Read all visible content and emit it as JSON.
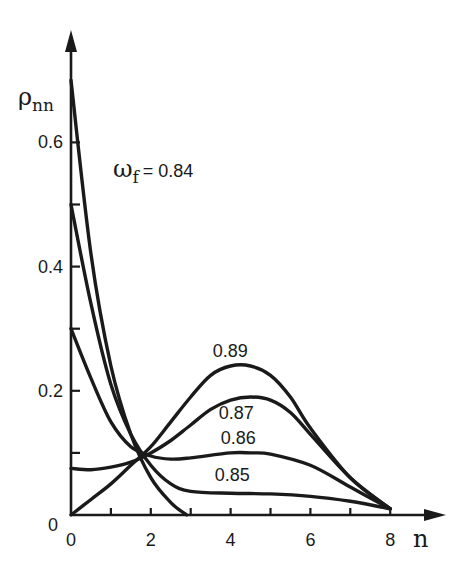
{
  "chart_data": {
    "type": "line",
    "title": "",
    "xlabel": "n",
    "ylabel": "ρ_nn",
    "ylabel_main": "ρ",
    "ylabel_sub": "nn",
    "xlim": [
      0,
      8.5
    ],
    "ylim": [
      0,
      0.75
    ],
    "grid": false,
    "legend": "inline labels",
    "x_ticks": [
      {
        "value": 0,
        "label": "0"
      },
      {
        "value": 1,
        "label": ""
      },
      {
        "value": 2,
        "label": "2"
      },
      {
        "value": 3,
        "label": ""
      },
      {
        "value": 4,
        "label": "4"
      },
      {
        "value": 5,
        "label": ""
      },
      {
        "value": 6,
        "label": "6"
      },
      {
        "value": 7,
        "label": ""
      },
      {
        "value": 8,
        "label": "8"
      }
    ],
    "y_ticks": [
      {
        "value": 0.1,
        "label": ""
      },
      {
        "value": 0.2,
        "label": "0.2"
      },
      {
        "value": 0.3,
        "label": ""
      },
      {
        "value": 0.4,
        "label": "0.4"
      },
      {
        "value": 0.5,
        "label": ""
      },
      {
        "value": 0.6,
        "label": "0.6"
      }
    ],
    "origin_label": "0",
    "series": [
      {
        "name": "ω_f = 0.84",
        "label": "0.84",
        "label_prefix": "ω",
        "label_sub": "f",
        "label_eq": "= 0.84",
        "x": [
          0,
          0.5,
          1.0,
          1.5,
          2.0,
          2.5,
          2.9
        ],
        "values": [
          0.7,
          0.42,
          0.24,
          0.13,
          0.06,
          0.02,
          0.0
        ]
      },
      {
        "name": "0.85",
        "label": "0.85",
        "x": [
          0,
          0.5,
          1.0,
          1.5,
          2.0,
          2.5,
          3.0,
          4.0,
          5.0,
          6.0,
          7.0,
          8.0
        ],
        "values": [
          0.5,
          0.34,
          0.21,
          0.13,
          0.08,
          0.05,
          0.038,
          0.035,
          0.034,
          0.03,
          0.022,
          0.01
        ]
      },
      {
        "name": "0.86",
        "label": "0.86",
        "x": [
          0,
          0.5,
          1.0,
          1.5,
          2.0,
          2.5,
          3.0,
          4.0,
          4.5,
          5.0,
          6.0,
          7.0,
          8.0
        ],
        "values": [
          0.3,
          0.22,
          0.15,
          0.11,
          0.095,
          0.09,
          0.092,
          0.1,
          0.1,
          0.098,
          0.08,
          0.045,
          0.01
        ]
      },
      {
        "name": "0.87",
        "label": "0.87",
        "x": [
          0,
          0.5,
          1.0,
          1.5,
          2.0,
          2.5,
          3.0,
          3.5,
          4.0,
          4.5,
          5.0,
          5.5,
          6.0,
          7.0,
          8.0
        ],
        "values": [
          0.075,
          0.073,
          0.077,
          0.085,
          0.1,
          0.12,
          0.145,
          0.17,
          0.185,
          0.19,
          0.185,
          0.165,
          0.13,
          0.06,
          0.01
        ]
      },
      {
        "name": "0.89",
        "label": "0.89",
        "x": [
          0,
          0.5,
          1.0,
          1.5,
          2.0,
          2.5,
          3.0,
          3.5,
          4.0,
          4.5,
          5.0,
          5.5,
          6.0,
          7.0,
          8.0
        ],
        "values": [
          0.0,
          0.025,
          0.05,
          0.08,
          0.11,
          0.15,
          0.19,
          0.225,
          0.24,
          0.24,
          0.225,
          0.19,
          0.14,
          0.06,
          0.01
        ]
      }
    ],
    "label_positions": [
      {
        "series": "ω_f = 0.84",
        "x": 1.05,
        "y": 0.545
      },
      {
        "series": "0.85",
        "x": 3.6,
        "y": 0.055
      },
      {
        "series": "0.86",
        "x": 3.75,
        "y": 0.115
      },
      {
        "series": "0.87",
        "x": 3.7,
        "y": 0.155
      },
      {
        "series": "0.89",
        "x": 3.55,
        "y": 0.255
      }
    ]
  }
}
